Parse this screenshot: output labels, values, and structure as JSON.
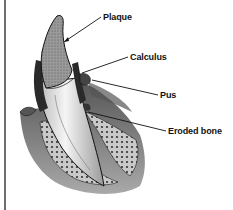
{
  "diagram": {
    "labels": [
      {
        "id": "plaque",
        "text": "Plaque"
      },
      {
        "id": "calculus",
        "text": "Calculus"
      },
      {
        "id": "pus",
        "text": "Pus"
      },
      {
        "id": "eroded-bone",
        "text": "Eroded bone"
      }
    ],
    "colors": {
      "background": "#ffffff",
      "ink": "#111111",
      "frame_line": "#6e6e6e",
      "crown": "#8a8a8a",
      "root": "#e6e6e6",
      "gum": "#5a5a5a",
      "bone": "#bdbdbd"
    }
  }
}
